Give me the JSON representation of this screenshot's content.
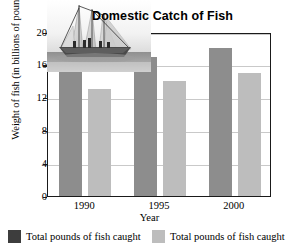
{
  "chart_data": {
    "type": "bar",
    "title": "Domestic Catch of Fish",
    "xlabel": "Year",
    "ylabel": "Weight of fish (in billions of pounds)",
    "categories": [
      "1990",
      "1995",
      "2000"
    ],
    "ylim": [
      0,
      20
    ],
    "yticks": [
      0,
      4,
      8,
      12,
      16,
      20
    ],
    "grid": true,
    "legend_position": "bottom",
    "series": [
      {
        "name": "Total pounds of fish caught",
        "color": "#8d8d8d",
        "values": [
          16,
          17,
          18
        ]
      },
      {
        "name": "Total pounds of fish caught",
        "color": "#bdbdbd",
        "values": [
          13,
          14,
          15
        ]
      }
    ]
  },
  "decoration": {
    "photo_name": "sailing-fishing-boat-photo"
  },
  "legend": {
    "items": [
      {
        "label": "Total pounds of fish caught",
        "swatch": "#3d3d3d"
      },
      {
        "label": "Total pounds of fish caught",
        "swatch": "#bdbdbd"
      }
    ]
  }
}
